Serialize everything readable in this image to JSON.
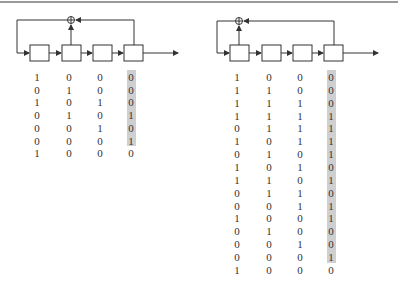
{
  "figure": {
    "left": {
      "name": "4-stage LFSR, taps 2 and 4",
      "stages": 4,
      "tap_stages": [
        2,
        4
      ],
      "rows": [
        [
          "1",
          "0",
          "0",
          "0"
        ],
        [
          "0",
          "1",
          "0",
          "0"
        ],
        [
          "1",
          "0",
          "1",
          "0"
        ],
        [
          "0",
          "1",
          "0",
          "1"
        ],
        [
          "0",
          "0",
          "1",
          "0"
        ],
        [
          "0",
          "0",
          "0",
          "1"
        ],
        [
          "1",
          "0",
          "0",
          "0"
        ]
      ],
      "highlighted_rows_in_last_column": 6
    },
    "right": {
      "name": "4-stage LFSR, taps 1 and 4",
      "stages": 4,
      "tap_stages": [
        1,
        4
      ],
      "rows": [
        [
          "1",
          "0",
          "0",
          "0"
        ],
        [
          "1",
          "1",
          "0",
          "0"
        ],
        [
          "1",
          "1",
          "1",
          "0"
        ],
        [
          "1",
          "1",
          "1",
          "1"
        ],
        [
          "0",
          "1",
          "1",
          "1"
        ],
        [
          "1",
          "0",
          "1",
          "1"
        ],
        [
          "0",
          "1",
          "0",
          "1"
        ],
        [
          "1",
          "0",
          "1",
          "0"
        ],
        [
          "1",
          "1",
          "0",
          "1"
        ],
        [
          "0",
          "1",
          "1",
          "0"
        ],
        [
          "0",
          "0",
          "1",
          "1"
        ],
        [
          "1",
          "0",
          "0",
          "1"
        ],
        [
          "0",
          "1",
          "0",
          "0"
        ],
        [
          "0",
          "0",
          "1",
          "0"
        ],
        [
          "0",
          "0",
          "0",
          "1"
        ],
        [
          "1",
          "0",
          "0",
          "0"
        ]
      ],
      "highlighted_rows_in_last_column": 15
    },
    "colors": {
      "line": "#333333",
      "highlight": "#cfcfcf",
      "top_rule": "#9a9a9a"
    }
  }
}
